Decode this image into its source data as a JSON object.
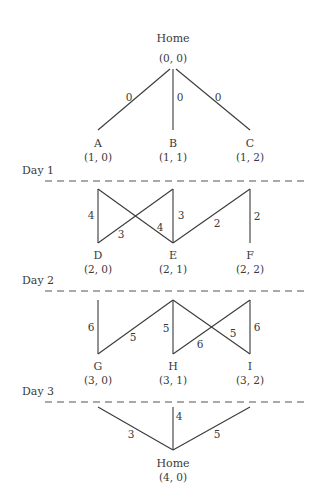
{
  "diagram": {
    "type": "staged-network",
    "nodes": {
      "home_start": {
        "name": "Home",
        "coord": "(0, 0)"
      },
      "A": {
        "name": "A",
        "coord": "(1, 0)"
      },
      "B": {
        "name": "B",
        "coord": "(1, 1)"
      },
      "C": {
        "name": "C",
        "coord": "(1, 2)"
      },
      "D": {
        "name": "D",
        "coord": "(2, 0)"
      },
      "E": {
        "name": "E",
        "coord": "(2, 1)"
      },
      "F": {
        "name": "F",
        "coord": "(2, 2)"
      },
      "G": {
        "name": "G",
        "coord": "(3, 0)"
      },
      "H": {
        "name": "H",
        "coord": "(3, 1)"
      },
      "I": {
        "name": "I",
        "coord": "(3, 2)"
      },
      "home_end": {
        "name": "Home",
        "coord": "(4, 0)"
      }
    },
    "days": {
      "day1": "Day 1",
      "day2": "Day 2",
      "day3": "Day 3"
    },
    "edges": [
      {
        "from": "Home (0,0)",
        "to": "A",
        "weight": "0"
      },
      {
        "from": "Home (0,0)",
        "to": "B",
        "weight": "0"
      },
      {
        "from": "Home (0,0)",
        "to": "C",
        "weight": "0"
      },
      {
        "from": "A",
        "to": "D",
        "weight": "4"
      },
      {
        "from": "A",
        "to": "E",
        "weight": "4"
      },
      {
        "from": "B",
        "to": "D",
        "weight": "3"
      },
      {
        "from": "B",
        "to": "E",
        "weight": "3"
      },
      {
        "from": "C",
        "to": "E",
        "weight": "2"
      },
      {
        "from": "C",
        "to": "F",
        "weight": "2"
      },
      {
        "from": "D",
        "to": "G",
        "weight": "6"
      },
      {
        "from": "E",
        "to": "G",
        "weight": "5"
      },
      {
        "from": "E",
        "to": "H",
        "weight": "5"
      },
      {
        "from": "E",
        "to": "I",
        "weight": "5"
      },
      {
        "from": "F",
        "to": "H",
        "weight": "6"
      },
      {
        "from": "F",
        "to": "I",
        "weight": "6"
      },
      {
        "from": "G",
        "to": "Home (4,0)",
        "weight": "3"
      },
      {
        "from": "H",
        "to": "Home (4,0)",
        "weight": "4"
      },
      {
        "from": "I",
        "to": "Home (4,0)",
        "weight": "5"
      }
    ],
    "weights": {
      "home_A": "0",
      "home_B": "0",
      "home_C": "0",
      "AD": "4",
      "AE": "4",
      "BD": "3",
      "BE": "3",
      "CE": "2",
      "CF": "2",
      "DG": "6",
      "EG": "5",
      "EH": "5",
      "EI": "5",
      "FH": "6",
      "FI": "6",
      "G_home": "3",
      "H_home": "4",
      "I_home": "5"
    }
  }
}
